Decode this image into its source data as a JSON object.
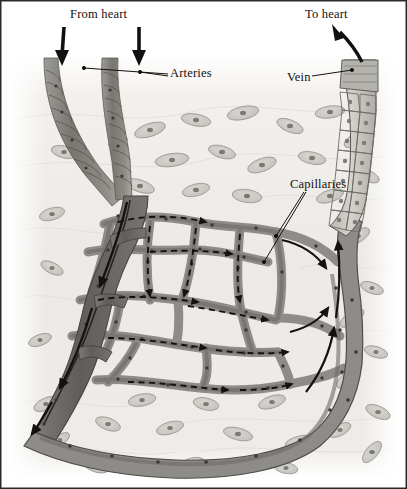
{
  "figure": {
    "width": 407,
    "height": 489,
    "style": "grayscale anatomical illustration",
    "background_color": "#ffffff",
    "tissue_color": "#e8e6e2",
    "vessel_fill_color": "#8e8c88",
    "arteriole_fill_color": "#6e6c69",
    "vessel_outline_color": "#4a4845",
    "label_color": "#111111",
    "frame_color": "#2a2a2a"
  },
  "labels": {
    "from_heart": "From heart",
    "to_heart": "To heart",
    "arteries": "Arteries",
    "vein": "Vein",
    "capillaries": "Capillaries"
  },
  "structures": [
    {
      "name": "artery-left",
      "type": "artery",
      "description": "banded smooth-muscle artery descending from top left"
    },
    {
      "name": "artery-right",
      "type": "artery",
      "description": "banded smooth-muscle artery descending, merges with left artery"
    },
    {
      "name": "arteriole",
      "type": "arteriole",
      "description": "dark merged arteriole descending to capillary bed"
    },
    {
      "name": "capillary-bed",
      "type": "capillary",
      "description": "branching anastomosing capillary network in center"
    },
    {
      "name": "venule",
      "type": "venule",
      "description": "large venule along bottom and right margin"
    },
    {
      "name": "vein",
      "type": "vein",
      "description": "cobblestone endothelial vein ascending at top right"
    }
  ],
  "flow": {
    "inflow_arrows": 2,
    "inflow_direction": "down",
    "outflow_arrows": 1,
    "outflow_direction": "up",
    "capillary_arrow_style": "dashed",
    "venous_arrow_style": "solid"
  }
}
